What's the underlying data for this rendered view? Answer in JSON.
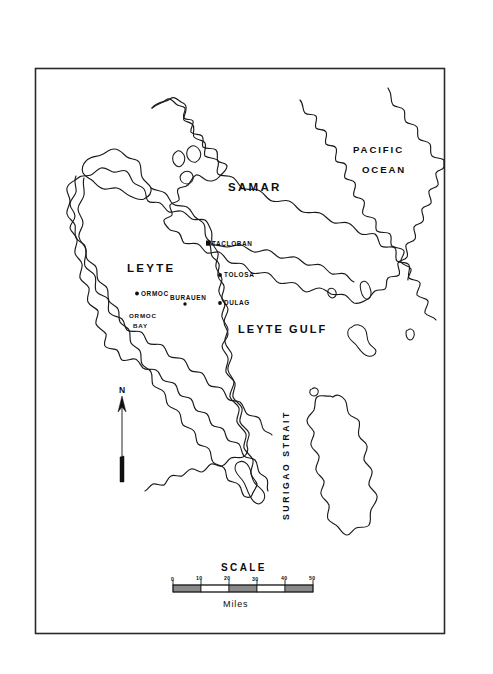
{
  "document": {
    "type": "map",
    "title": "Leyte",
    "background_color": "#ffffff",
    "ink_color": "#1a1a1a"
  },
  "frame": {
    "name": "map-border",
    "x": 35,
    "y": 68,
    "width": 410,
    "height": 566
  },
  "regions": [
    {
      "id": "leyte",
      "label": "LEYTE",
      "x": 152,
      "y": 270
    },
    {
      "id": "samar",
      "label": "SAMAR",
      "x": 255,
      "y": 188
    }
  ],
  "oceans": [
    {
      "id": "pacific",
      "line1": "PACIFIC",
      "line2": "OCEAN",
      "x": 383,
      "y": 150
    }
  ],
  "water_bodies": [
    {
      "id": "leyte-gulf",
      "label": "LEYTE GULF",
      "x": 290,
      "y": 329
    },
    {
      "id": "surigao-strait",
      "label": "SURIGAO STRAIT",
      "x": 288,
      "y": 455
    },
    {
      "id": "ormoc-bay",
      "line1": "ORMOC",
      "line2": "BAY",
      "x": 146,
      "y": 318
    }
  ],
  "cities": [
    {
      "id": "tacloban",
      "label": "TACLOBAN",
      "marker": "square",
      "dot_x": 208,
      "dot_y": 243,
      "label_x": 213,
      "label_y": 245
    },
    {
      "id": "tolosa",
      "label": "TOLOSA",
      "marker": "dot",
      "dot_x": 219,
      "dot_y": 275,
      "label_x": 223,
      "label_y": 277
    },
    {
      "id": "dulag",
      "label": "DULAG",
      "marker": "dot",
      "dot_x": 219,
      "dot_y": 303,
      "label_x": 223,
      "label_y": 305
    },
    {
      "id": "ormoc",
      "label": "ORMOC",
      "marker": "dot",
      "dot_x": 137,
      "dot_y": 293,
      "label_x": 141,
      "label_y": 295
    },
    {
      "id": "burauen",
      "label": "BURAUEN",
      "marker": "dot",
      "dot_x": 186,
      "dot_y": 303,
      "label_x": 172,
      "label_y": 298
    }
  ],
  "compass": {
    "label": "N",
    "label_x": 124,
    "label_y": 392,
    "shaft_x": 122,
    "shaft_top": 396,
    "shaft_bottom": 482
  },
  "scale_bar": {
    "title": "SCALE",
    "title_x": 245,
    "title_y": 568,
    "unit_label": "Miles",
    "unit_x": 237,
    "unit_y": 605,
    "ticks": [
      "0",
      "10",
      "20",
      "30",
      "40",
      "50"
    ],
    "bar_x": 173,
    "bar_y": 585,
    "bar_width": 140,
    "bar_height": 7,
    "segments": 5,
    "segment_fills": [
      "filled",
      "empty",
      "filled",
      "empty",
      "filled"
    ]
  }
}
